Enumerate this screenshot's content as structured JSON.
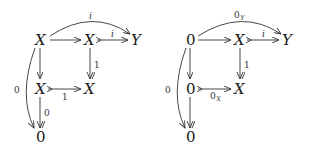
{
  "diagrams": [
    {
      "name": "left",
      "nodes": {
        "top_left": "X",
        "top_mid": "X",
        "top_right": "Y",
        "mid_left": "X",
        "mid_mid": "X",
        "bottom": "0"
      },
      "labels": {
        "curve_top": "i",
        "top_mid_to_right": "i",
        "right_vertical": "1",
        "mid_horizontal": "1",
        "lower_vertical": "0",
        "curve_left": "0"
      }
    },
    {
      "name": "right",
      "nodes": {
        "top_left": "0",
        "top_mid": "X",
        "top_right": "Y",
        "mid_left": "0",
        "mid_mid": "X",
        "bottom": "0"
      },
      "labels": {
        "curve_top": "0",
        "curve_top_sub": "Y",
        "top_mid_to_right": "i",
        "right_vertical": "1",
        "mid_horizontal": "0",
        "mid_horizontal_sub": "X",
        "curve_left": "0"
      }
    }
  ]
}
